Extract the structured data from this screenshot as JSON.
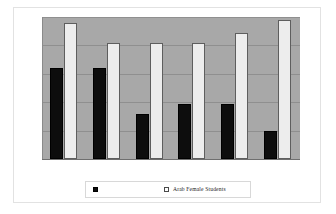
{
  "figure": {
    "background_color": "#ffffff",
    "frame_color": "#e2e2e2"
  },
  "legend": {
    "position": "bottom",
    "entries": [
      {
        "marker": "filled-square-marker",
        "label": "",
        "color": "#0d0d0d"
      },
      {
        "marker": "open-square-marker",
        "label": "Arab Female Students",
        "color": "#ededed"
      }
    ]
  },
  "chart_data": {
    "type": "bar",
    "title": "",
    "subtitle": "",
    "xlabel": "",
    "ylabel": "",
    "categories": [
      "1",
      "2",
      "3",
      "4",
      "5",
      "6"
    ],
    "tick_labels": [],
    "ylim": [
      0,
      100
    ],
    "grid": true,
    "gridlines": [
      20,
      40,
      60,
      80,
      100
    ],
    "plot_background_color": "#a8a8a8",
    "gridline_color": "#8f8f8f",
    "legend_position": "bottom",
    "series": [
      {
        "name": "",
        "color": "#0d0d0d",
        "marker": "filled-square-marker",
        "values": [
          64,
          64,
          32,
          39,
          39,
          20
        ]
      },
      {
        "name": "Arab Female Students",
        "color": "#ededed",
        "marker": "open-square-marker",
        "values": [
          96,
          82,
          82,
          82,
          89,
          98
        ]
      }
    ]
  }
}
